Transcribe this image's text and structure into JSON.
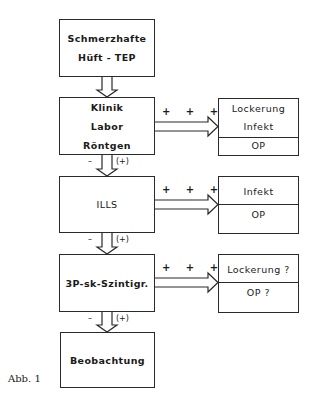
{
  "diagram": {
    "main_steps": [
      {
        "lines": [
          "Schmerzhafte",
          "Hüft - TEP"
        ]
      },
      {
        "lines": [
          "Klinik",
          "Labor",
          "Röntgen"
        ]
      },
      {
        "lines": [
          "ILLS"
        ]
      },
      {
        "lines": [
          "3P-sk-Szintigr."
        ]
      },
      {
        "lines": [
          "Beobachtung"
        ]
      }
    ],
    "positive_label": "+ + +",
    "negative_label": "–",
    "uncertain_label": "(+)",
    "outcomes": [
      {
        "diagnosis": [
          "Lockerung",
          "Infekt"
        ],
        "action": "OP"
      },
      {
        "diagnosis": [
          "Infekt"
        ],
        "action": "OP"
      },
      {
        "diagnosis": [
          "Lockerung ?"
        ],
        "action": "OP ?"
      }
    ],
    "caption": "Abb. 1"
  }
}
